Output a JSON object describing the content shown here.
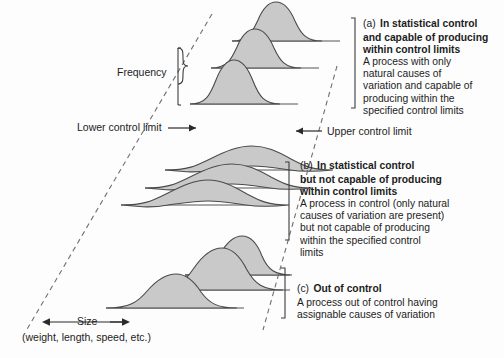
{
  "figure": {
    "axis_labels": {
      "frequency": "Frequency",
      "lower_control_limit": "Lower control limit",
      "upper_control_limit": "Upper control limit",
      "size": "Size",
      "size_units": "(weight, length, speed, etc.)"
    },
    "colors": {
      "curve_fill": "#c9c9c9",
      "curve_stroke": "#4a4a4a",
      "dashed_limit": "#6f6f6f",
      "baseline": "#555555",
      "text": "#1c1c1c",
      "background": "#fdfdfd"
    },
    "sections": [
      {
        "tag": "(a)",
        "title": "In statistical control and capable of producing within control limits",
        "title_lines": [
          "In statistical control",
          "and capable of producing",
          "within control limits"
        ],
        "body_lines": [
          "A process with only",
          "natural causes of",
          "variation and capable of",
          "producing within the",
          "specified control limits"
        ],
        "curve_count": 3,
        "curve_style": "narrow",
        "curves_within_limits": true
      },
      {
        "tag": "(b)",
        "title": "In statistical control but not capable of producing within control limits",
        "title_lines": [
          "In statistical control",
          "but not capable of producing",
          "within control limits"
        ],
        "body_lines": [
          "A process in control (only natural",
          "causes of variation are present)",
          "but not capable of producing",
          "within the specified control",
          "limits"
        ],
        "curve_count": 3,
        "curve_style": "wide-flat",
        "curves_within_limits": false
      },
      {
        "tag": "(c)",
        "title": "Out of control",
        "title_lines": [
          "Out of control"
        ],
        "body_lines": [
          "A process out of control having",
          "assignable causes of variation"
        ],
        "curve_count": 3,
        "curve_style": "shifting-mean",
        "curves_within_limits": false
      }
    ]
  }
}
